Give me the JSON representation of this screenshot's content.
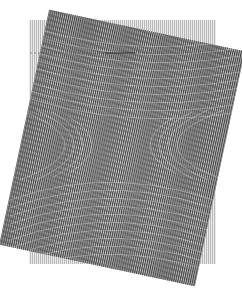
{
  "figure": {
    "background_color": "#ffffff",
    "back_grating": {
      "x": 29,
      "y": 20,
      "width": 187,
      "height": 244,
      "line_color": "#8a8a8a",
      "fill_color": "#d6d6d6",
      "line_spacing": 2,
      "line_width": 1,
      "rotation_deg": 0
    },
    "front_grating": {
      "center_x": 122,
      "center_y": 148,
      "width": 200,
      "height": 240,
      "line_color": "#3c3c3c",
      "line_spacing": 2.1,
      "line_width": 1,
      "rotation_deg": 12
    },
    "moire_center": {
      "x": 120,
      "y": 145
    }
  }
}
